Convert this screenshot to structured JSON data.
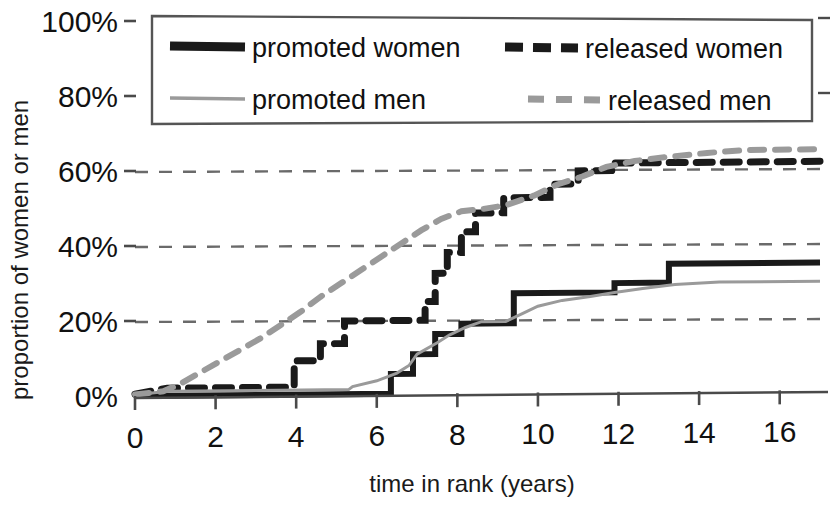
{
  "chart_data": {
    "type": "line",
    "title": "",
    "subtitle": "",
    "xlabel": "time in rank (years)",
    "ylabel": "proportion of women or men",
    "xlim": [
      0,
      17
    ],
    "ylim": [
      0,
      1.0
    ],
    "xticks": [
      0,
      2,
      4,
      6,
      8,
      10,
      12,
      14,
      16
    ],
    "xtick_labels": [
      "0",
      "2",
      "4",
      "6",
      "8",
      "10",
      "12",
      "14",
      "16"
    ],
    "yticks": [
      0,
      0.2,
      0.4,
      0.6,
      0.8,
      1.0
    ],
    "ytick_labels": [
      "0%",
      "20%",
      "40%",
      "60%",
      "80%",
      "100%"
    ],
    "grid": "horizontal-dashed",
    "legend_position": "top",
    "series": [
      {
        "name": "promoted women",
        "style": "solid",
        "color": "#1a1a1a",
        "width": 6,
        "points": [
          [
            0,
            0
          ],
          [
            6.35,
            0
          ],
          [
            6.35,
            0.053
          ],
          [
            6.9,
            0.053
          ],
          [
            6.9,
            0.105
          ],
          [
            7.45,
            0.105
          ],
          [
            7.45,
            0.158
          ],
          [
            8.1,
            0.158
          ],
          [
            8.1,
            0.185
          ],
          [
            9.4,
            0.185
          ],
          [
            9.4,
            0.265
          ],
          [
            11.9,
            0.265
          ],
          [
            11.9,
            0.29
          ],
          [
            13.25,
            0.29
          ],
          [
            13.25,
            0.34
          ],
          [
            17,
            0.34
          ]
        ]
      },
      {
        "name": "released women",
        "style": "dashed",
        "color": "#1a1a1a",
        "width": 7,
        "points": [
          [
            0,
            0.005
          ],
          [
            0.8,
            0.02
          ],
          [
            3.95,
            0.02
          ],
          [
            3.95,
            0.09
          ],
          [
            4.6,
            0.09
          ],
          [
            4.6,
            0.135
          ],
          [
            5.2,
            0.135
          ],
          [
            5.2,
            0.195
          ],
          [
            7.2,
            0.195
          ],
          [
            7.2,
            0.245
          ],
          [
            7.45,
            0.245
          ],
          [
            7.45,
            0.32
          ],
          [
            7.75,
            0.32
          ],
          [
            7.75,
            0.375
          ],
          [
            8.1,
            0.375
          ],
          [
            8.1,
            0.43
          ],
          [
            8.45,
            0.43
          ],
          [
            8.45,
            0.48
          ],
          [
            9.15,
            0.48
          ],
          [
            9.15,
            0.52
          ],
          [
            10.3,
            0.52
          ],
          [
            10.3,
            0.555
          ],
          [
            11.0,
            0.555
          ],
          [
            11.0,
            0.59
          ],
          [
            11.9,
            0.59
          ],
          [
            11.9,
            0.61
          ],
          [
            17,
            0.61
          ]
        ]
      },
      {
        "name": "promoted men",
        "style": "solid",
        "color": "#9a9a9a",
        "width": 3,
        "points": [
          [
            0,
            0.003
          ],
          [
            0.8,
            0.012
          ],
          [
            5.3,
            0.012
          ],
          [
            5.4,
            0.02
          ],
          [
            6.0,
            0.035
          ],
          [
            6.5,
            0.055
          ],
          [
            6.8,
            0.075
          ],
          [
            7.0,
            0.105
          ],
          [
            7.5,
            0.135
          ],
          [
            7.8,
            0.155
          ],
          [
            8.2,
            0.175
          ],
          [
            8.6,
            0.19
          ],
          [
            9.2,
            0.19
          ],
          [
            9.6,
            0.21
          ],
          [
            10.0,
            0.23
          ],
          [
            10.6,
            0.245
          ],
          [
            11.3,
            0.255
          ],
          [
            11.9,
            0.265
          ],
          [
            12.6,
            0.275
          ],
          [
            13.4,
            0.285
          ],
          [
            14.5,
            0.29
          ],
          [
            17,
            0.29
          ]
        ]
      },
      {
        "name": "released men",
        "style": "dashed",
        "color": "#9a9a9a",
        "width": 6,
        "points": [
          [
            0,
            0.004
          ],
          [
            0.7,
            0.012
          ],
          [
            1.1,
            0.03
          ],
          [
            1.6,
            0.06
          ],
          [
            2.1,
            0.09
          ],
          [
            2.6,
            0.12
          ],
          [
            3.1,
            0.15
          ],
          [
            3.6,
            0.185
          ],
          [
            4.1,
            0.22
          ],
          [
            4.6,
            0.26
          ],
          [
            5.1,
            0.295
          ],
          [
            5.6,
            0.33
          ],
          [
            6.1,
            0.365
          ],
          [
            6.6,
            0.4
          ],
          [
            7.1,
            0.435
          ],
          [
            7.6,
            0.465
          ],
          [
            8.1,
            0.485
          ],
          [
            8.6,
            0.49
          ],
          [
            9.2,
            0.5
          ],
          [
            9.9,
            0.525
          ],
          [
            10.5,
            0.555
          ],
          [
            11.1,
            0.575
          ],
          [
            11.7,
            0.6
          ],
          [
            12.4,
            0.615
          ],
          [
            13.2,
            0.625
          ],
          [
            14.2,
            0.635
          ],
          [
            15.2,
            0.642
          ],
          [
            17,
            0.642
          ]
        ]
      }
    ]
  },
  "axes": {
    "ylabel": "proportion of women or men",
    "xlabel": "time in rank (years)",
    "ytick_labels": [
      "100%",
      "80%",
      "60%",
      "40%",
      "20%",
      "0%"
    ],
    "xtick_labels": [
      "0",
      "2",
      "4",
      "6",
      "8",
      "10",
      "12",
      "14",
      "16"
    ]
  },
  "legend": {
    "entries": [
      {
        "label": "promoted women",
        "style": "solid",
        "color": "#1a1a1a"
      },
      {
        "label": "released women",
        "style": "dashed",
        "color": "#1a1a1a"
      },
      {
        "label": "promoted men",
        "style": "solid-thin",
        "color": "#9a9a9a"
      },
      {
        "label": "released men",
        "style": "dashed",
        "color": "#9a9a9a"
      }
    ]
  },
  "colors": {
    "women": "#1a1a1a",
    "men": "#9a9a9a",
    "grid": "#6e6e6e",
    "axis": "#4a4a4a",
    "background": "#ffffff"
  }
}
